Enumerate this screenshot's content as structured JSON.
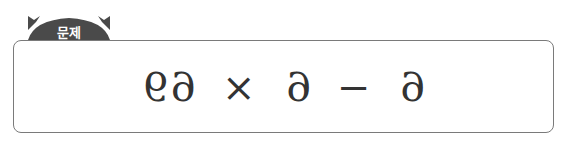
{
  "header": {
    "tab_label": "문제",
    "tab_color": "#4a4a4a"
  },
  "problem": {
    "expression_mirrored": "69 × 6 − 6",
    "tokens": [
      "69",
      "×",
      "6",
      "−",
      "6"
    ]
  }
}
